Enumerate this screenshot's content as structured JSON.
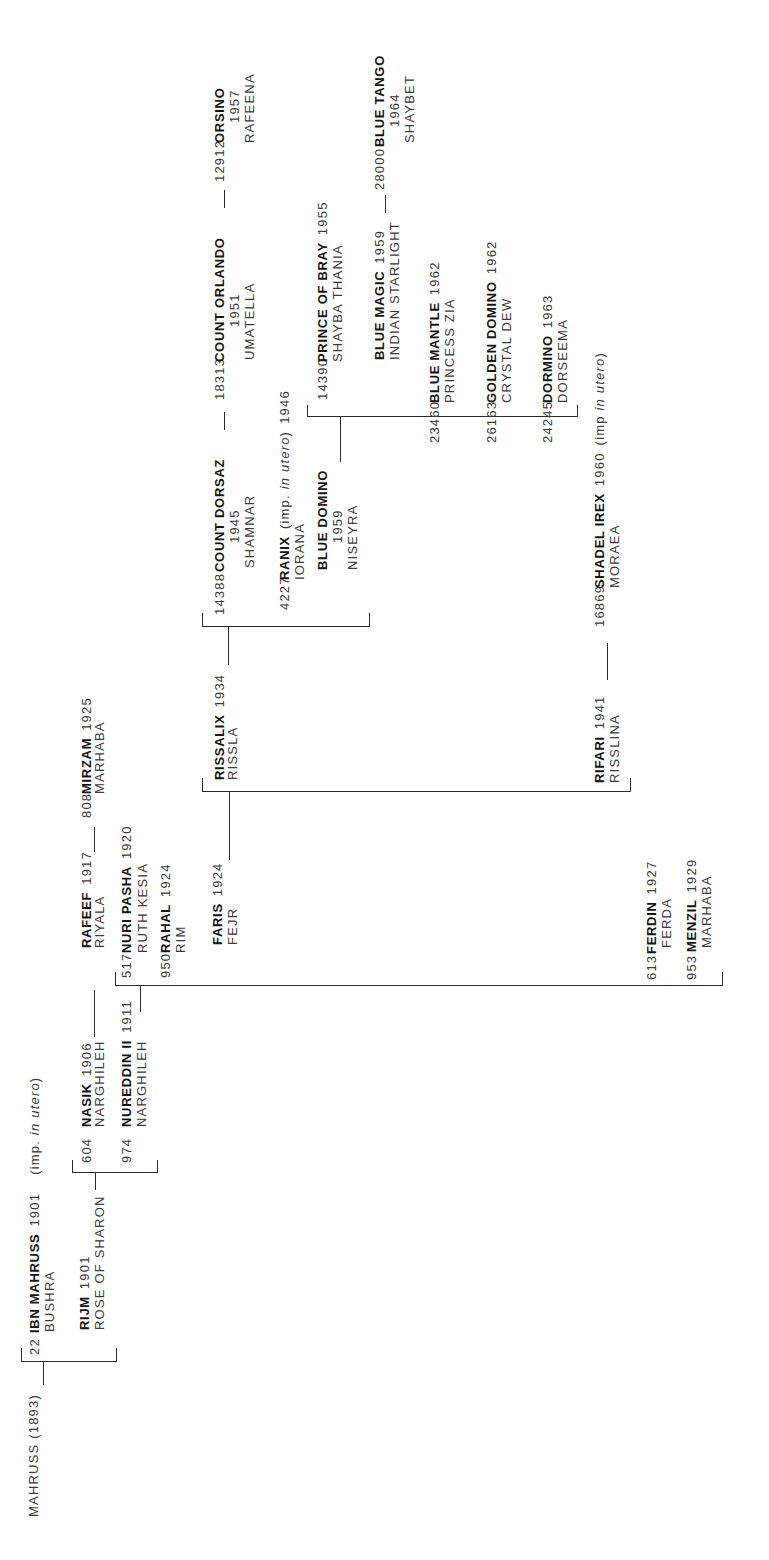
{
  "pedigree": {
    "root": {
      "label": "MAHRUSS (1893)"
    },
    "horses": {
      "ibn_mahruss": {
        "number": "22",
        "name": "IBN MAHRUSS",
        "year": "1901",
        "note": {
          "pre": "(imp. ",
          "italic": "in utero",
          "post": ")"
        },
        "dam": "BUSHRA"
      },
      "rijm": {
        "name": "RIJM",
        "year": "1901",
        "dam": "ROSE OF SHARON"
      },
      "nasik": {
        "number": "604",
        "name": "NASIK",
        "year": "1906",
        "dam": "NARGHILEH"
      },
      "nureddin_ii": {
        "number": "974",
        "name": "NUREDDIN II",
        "year": "1911",
        "dam": "NARGHILEH"
      },
      "rafeef": {
        "name": "RAFEEF",
        "year": "1917",
        "dam": "RIYALA"
      },
      "mirzam": {
        "number": "808",
        "name": "MIRZAM",
        "year": "1925",
        "dam": "MARHABA"
      },
      "nuri_pasha": {
        "number": "517",
        "name": "NURI PASHA",
        "year": "1920",
        "dam": "RUTH KESIA"
      },
      "rahal": {
        "number": "950",
        "name": "RAHAL",
        "year": "1924",
        "dam": "RIM"
      },
      "faris": {
        "name": "FARIS",
        "year": "1924",
        "dam": "FEJR"
      },
      "ferdin": {
        "number": "613",
        "name": "FERDIN",
        "year": "1927",
        "dam": "FERDA"
      },
      "menzil": {
        "number": "953",
        "name": "MENZIL",
        "year": "1929",
        "dam": "MARHABA"
      },
      "rissalix": {
        "name": "RISSALIX",
        "year": "1934",
        "dam": "RISSLA"
      },
      "rifari": {
        "name": "RIFARI",
        "year": "1941",
        "dam": "RISSLINA"
      },
      "shadel_irex": {
        "number": "16869",
        "name": "SHADEL IREX",
        "year": "1960",
        "note": {
          "pre": "(imp ",
          "italic": "in utero",
          "post": ")"
        },
        "dam": "MORAEA"
      },
      "count_dorsaz": {
        "number": "14388",
        "name": "COUNT DORSAZ",
        "year": "1945",
        "dam": "SHAMNAR"
      },
      "ranix": {
        "number": "4227",
        "name": "RANIX",
        "note": {
          "pre": "(imp. ",
          "italic": "in utero",
          "post": ")"
        },
        "year": "1946",
        "dam": "IORANA"
      },
      "blue_domino": {
        "name": "BLUE DOMINO",
        "year": "1959",
        "dam": "NISEYRA"
      },
      "count_orlando": {
        "number": "18313",
        "name": "COUNT ORLANDO",
        "year": "1951",
        "dam": "UMATELLA"
      },
      "orsino": {
        "number": "12912",
        "name": "ORSINO",
        "year": "1957",
        "dam": "RAFEENA"
      },
      "prince_of_bray": {
        "number": "14390",
        "name": "PRINCE OF BRAY",
        "year": "1955",
        "dam": "SHAYBA THANIA"
      },
      "blue_magic": {
        "name": "BLUE MAGIC",
        "year": "1959",
        "dam": "INDIAN STARLIGHT"
      },
      "blue_tango": {
        "number": "28000",
        "name": "BLUE TANGO",
        "year": "1964",
        "dam": "SHAYBET"
      },
      "blue_mantle": {
        "number": "23460",
        "name": "BLUE MANTLE",
        "year": "1962",
        "dam": "PRINCESS ZIA"
      },
      "golden_domino": {
        "number": "26163",
        "name": "GOLDEN DOMINO",
        "year": "1962",
        "dam": "CRYSTAL DEW"
      },
      "dormino": {
        "number": "24245",
        "name": "DORMINO",
        "year": "1963",
        "dam": "DORSEEMA"
      }
    },
    "lineage": [
      {
        "sire": "MAHRUSS (1893)",
        "offspring": [
          "ibn_mahruss",
          "rijm"
        ]
      },
      {
        "sire": "rijm",
        "offspring": [
          "nasik",
          "nureddin_ii"
        ]
      },
      {
        "sire": "nasik",
        "offspring": [
          "rafeef"
        ]
      },
      {
        "sire": "rafeef",
        "offspring": [
          "mirzam"
        ]
      },
      {
        "sire": "nureddin_ii",
        "offspring": [
          "nuri_pasha",
          "rahal",
          "faris",
          "ferdin",
          "menzil"
        ]
      },
      {
        "sire": "faris",
        "offspring": [
          "rissalix",
          "rifari"
        ]
      },
      {
        "sire": "rissalix",
        "offspring": [
          "count_dorsaz",
          "ranix",
          "blue_domino"
        ]
      },
      {
        "sire": "count_dorsaz",
        "offspring": [
          "count_orlando"
        ]
      },
      {
        "sire": "count_orlando",
        "offspring": [
          "orsino"
        ]
      },
      {
        "sire": "blue_domino",
        "offspring": [
          "prince_of_bray",
          "blue_magic",
          "blue_mantle",
          "golden_domino",
          "dormino"
        ]
      },
      {
        "sire": "blue_magic",
        "offspring": [
          "blue_tango"
        ]
      },
      {
        "sire": "rifari",
        "offspring": [
          "shadel_irex"
        ]
      }
    ]
  }
}
